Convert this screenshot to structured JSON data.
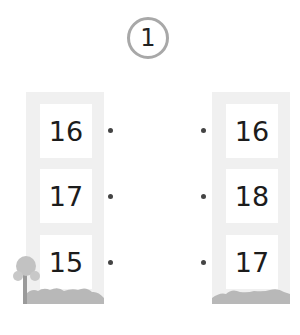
{
  "question_number": "1",
  "left_column": {
    "values": [
      "16",
      "17",
      "15"
    ]
  },
  "right_column": {
    "values": [
      "16",
      "18",
      "17"
    ]
  },
  "colors": {
    "tower": "#f0f0f0",
    "ground": "#b5b5b5",
    "badge_border": "#a8a8a8",
    "dot": "#444444"
  }
}
